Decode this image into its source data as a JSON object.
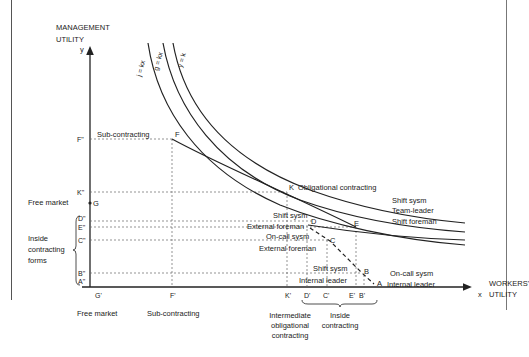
{
  "axes": {
    "y_title_line1": "MANAGEMENT",
    "y_title_line2": "UTILITY",
    "y_symbol": "y",
    "x_title_line1": "WORKERS'",
    "x_title_line2": "UTILITY",
    "x_symbol": "x"
  },
  "curves": [
    {
      "label": "j = kx"
    },
    {
      "label": "g = kx"
    },
    {
      "label": "y = k"
    }
  ],
  "y_ticks": {
    "F": "F\"",
    "K": "K\"",
    "G": "G",
    "D": "D\"",
    "E": "E\"",
    "C": "C\"",
    "B": "B\"",
    "A": "A\""
  },
  "x_ticks": {
    "G": "G'",
    "F": "F'",
    "K": "K'",
    "D": "D'",
    "C": "C'",
    "E": "E'",
    "B": "B'"
  },
  "points": {
    "F": "F",
    "K": "K",
    "D": "D",
    "C": "C",
    "E": "E",
    "B": "B",
    "A": "A"
  },
  "left_labels": {
    "free_market": "Free market",
    "inside_line1": "Inside",
    "inside_line2": "contracting",
    "inside_line3": "forms"
  },
  "annotations": {
    "sub_contracting": "Sub-contracting",
    "obligational": "Obligational contracting",
    "right_shift_sysm": "Shift sysm",
    "right_team_leader": "Team-leader",
    "right_shift_foreman": "Shift foreman",
    "shift_sysm_d": "Shift sysm",
    "external_foreman_d": "External foreman",
    "on_call_sysm_c": "On-call sysm",
    "external_foreman_c": "External foreman",
    "shift_sysm_b": "Shift sysm",
    "internal_leader_b": "Internal leader",
    "on_call_sysm_a": "On-call sysm",
    "internal_leader_a": "Internal leader"
  },
  "bottom_labels": {
    "free_market": "Free market",
    "sub_contracting": "Sub-contracting",
    "intermediate_1": "Intermediate",
    "intermediate_2": "obligational",
    "intermediate_3": "contracting",
    "inside_1": "Inside",
    "inside_2": "contracting"
  }
}
